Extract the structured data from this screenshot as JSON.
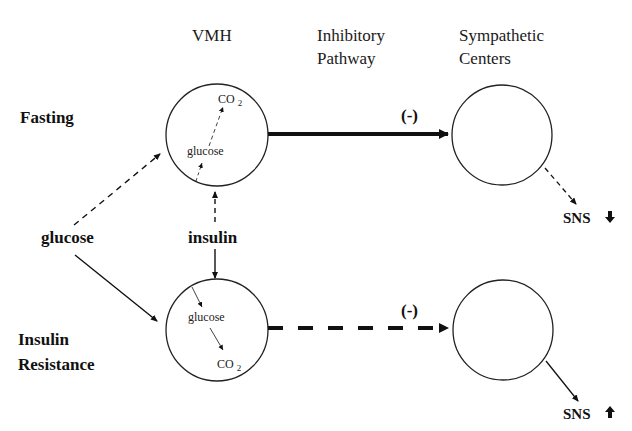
{
  "headers": {
    "vmh": "VMH",
    "pathway_line1": "Inhibitory",
    "pathway_line2": "Pathway",
    "centers_line1": "Sympathetic",
    "centers_line2": "Centers"
  },
  "rows": {
    "fasting": "Fasting",
    "insulin_resistance_line1": "Insulin",
    "insulin_resistance_line2": "Resistance"
  },
  "inputs": {
    "glucose": "glucose",
    "insulin": "insulin"
  },
  "vmh_top": {
    "glucose": "glucose",
    "co2_main": "CO",
    "co2_sub": "2"
  },
  "vmh_bottom": {
    "glucose": "glucose",
    "co2_main": "CO",
    "co2_sub": "2"
  },
  "pathway": {
    "top_sign": "(-)",
    "bottom_sign": "(-)"
  },
  "outputs": {
    "top_label": "SNS",
    "top_direction": "down-arrow",
    "bottom_label": "SNS",
    "bottom_direction": "up-arrow"
  },
  "colors": {
    "ink": "#111111",
    "background": "#ffffff"
  }
}
